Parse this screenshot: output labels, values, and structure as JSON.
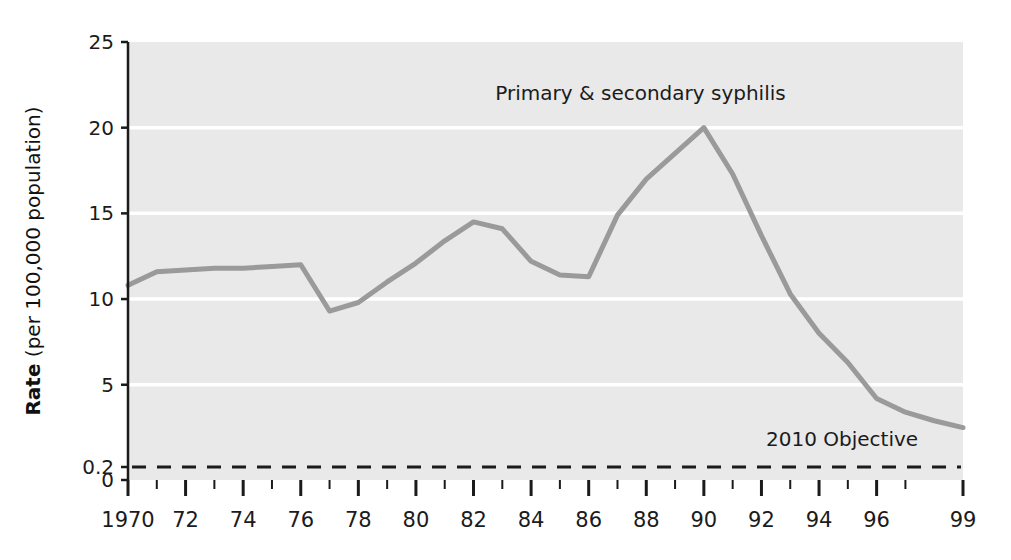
{
  "chart_data": {
    "type": "line",
    "title": "",
    "xlabel": "",
    "ylabel": "Rate (per 100,000 population)",
    "ylabel_bold_part": "Rate",
    "ylabel_rest_part": " (per 100,000 population)",
    "grid": true,
    "legend_position": "inline-annotation",
    "xlim": [
      1970,
      1999
    ],
    "ylim": [
      0,
      25
    ],
    "yticks": [
      0,
      0.2,
      5,
      10,
      15,
      20,
      25
    ],
    "ytick_labels": [
      "0",
      "0.2",
      "5",
      "10",
      "15",
      "20",
      "25"
    ],
    "gridline_values": [
      5,
      10,
      15,
      20
    ],
    "x": [
      1970,
      1971,
      1972,
      1973,
      1974,
      1975,
      1976,
      1977,
      1978,
      1979,
      1980,
      1981,
      1982,
      1983,
      1984,
      1985,
      1986,
      1987,
      1988,
      1989,
      1990,
      1991,
      1992,
      1993,
      1994,
      1995,
      1996,
      1997,
      1998,
      1999
    ],
    "xtick_major_values": [
      1970,
      1972,
      1974,
      1976,
      1978,
      1980,
      1982,
      1984,
      1986,
      1988,
      1990,
      1992,
      1994,
      1996,
      1999
    ],
    "xtick_major_labels": [
      "1970",
      "72",
      "74",
      "76",
      "78",
      "80",
      "82",
      "84",
      "86",
      "88",
      "90",
      "92",
      "94",
      "96",
      "99"
    ],
    "xtick_minor_values": [
      1971,
      1973,
      1975,
      1977,
      1979,
      1981,
      1983,
      1985,
      1987,
      1989,
      1991,
      1993,
      1995,
      1997
    ],
    "series": [
      {
        "name": "Primary & secondary syphilis",
        "annotation": "Primary & secondary syphilis",
        "color": "#9a9a9a",
        "style": "solid",
        "linewidth": 5,
        "values": [
          10.8,
          11.6,
          11.7,
          11.8,
          11.8,
          11.9,
          12.0,
          9.3,
          9.8,
          11.0,
          12.1,
          13.4,
          14.5,
          14.1,
          12.2,
          11.4,
          11.3,
          14.9,
          17.0,
          18.5,
          20.0,
          17.3,
          13.7,
          10.3,
          8.0,
          6.3,
          4.2,
          3.4,
          2.9,
          2.5
        ]
      },
      {
        "name": "2010 Objective",
        "annotation": "2010 Objective",
        "color": "#1b1b1b",
        "style": "dashed",
        "linewidth": 3,
        "constant_value": 0.2
      }
    ],
    "annotations": [
      {
        "text": "Primary & secondary syphilis",
        "x": 1987.8,
        "y": 21.6
      },
      {
        "text": "2010 Objective",
        "x": 1994.8,
        "y": 1.45
      }
    ],
    "plot_background": "#e9e9e9",
    "gridline_color": "#ffffff",
    "axis_color": "#1b1b1b"
  }
}
